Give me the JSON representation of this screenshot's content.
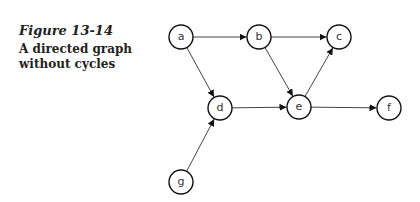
{
  "caption": {
    "figure_number": "Figure 13-14",
    "title": "A directed graph without cycles"
  },
  "graph": {
    "directed": true,
    "acyclic": true,
    "node_radius": 12,
    "nodes": [
      {
        "id": "a",
        "label": "a",
        "x": 181,
        "y": 37
      },
      {
        "id": "b",
        "label": "b",
        "x": 259,
        "y": 37
      },
      {
        "id": "c",
        "label": "c",
        "x": 339,
        "y": 37
      },
      {
        "id": "d",
        "label": "d",
        "x": 220,
        "y": 108
      },
      {
        "id": "e",
        "label": "e",
        "x": 299,
        "y": 107
      },
      {
        "id": "f",
        "label": "f",
        "x": 389,
        "y": 108
      },
      {
        "id": "g",
        "label": "g",
        "x": 181,
        "y": 182
      }
    ],
    "edges": [
      {
        "from": "a",
        "to": "b"
      },
      {
        "from": "a",
        "to": "d"
      },
      {
        "from": "b",
        "to": "c"
      },
      {
        "from": "b",
        "to": "e"
      },
      {
        "from": "d",
        "to": "e"
      },
      {
        "from": "e",
        "to": "c"
      },
      {
        "from": "e",
        "to": "f"
      },
      {
        "from": "g",
        "to": "d"
      }
    ]
  }
}
